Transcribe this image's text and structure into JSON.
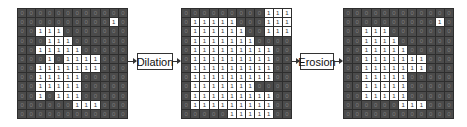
{
  "diagram": {
    "operations": [
      {
        "label": "Dilation"
      },
      {
        "label": "Erosion"
      }
    ],
    "colors": {
      "zero_cell": "#4b4b4b",
      "zero_text": "#7c7c7c",
      "one_cell": "#ffffff",
      "one_text": "#333333",
      "grid_line": "#2e2e2e"
    },
    "grids": {
      "input": [
        [
          0,
          0,
          0,
          0,
          0,
          0,
          0,
          0,
          0,
          0,
          0,
          0
        ],
        [
          0,
          0,
          0,
          0,
          0,
          0,
          0,
          0,
          0,
          0,
          1,
          0
        ],
        [
          0,
          0,
          1,
          1,
          1,
          0,
          0,
          0,
          0,
          0,
          0,
          0
        ],
        [
          0,
          0,
          0,
          1,
          1,
          1,
          0,
          0,
          0,
          0,
          0,
          0
        ],
        [
          0,
          0,
          1,
          1,
          1,
          1,
          1,
          0,
          0,
          0,
          0,
          0
        ],
        [
          0,
          0,
          0,
          1,
          0,
          1,
          1,
          1,
          1,
          0,
          0,
          0
        ],
        [
          0,
          0,
          1,
          1,
          1,
          1,
          1,
          1,
          1,
          0,
          0,
          0
        ],
        [
          0,
          0,
          1,
          1,
          1,
          1,
          1,
          0,
          0,
          0,
          0,
          0
        ],
        [
          0,
          0,
          1,
          1,
          1,
          1,
          1,
          0,
          0,
          0,
          0,
          0
        ],
        [
          0,
          0,
          1,
          0,
          1,
          1,
          1,
          0,
          0,
          0,
          0,
          0
        ],
        [
          0,
          0,
          0,
          0,
          0,
          0,
          1,
          1,
          1,
          0,
          0,
          0
        ],
        [
          0,
          0,
          0,
          0,
          0,
          0,
          0,
          0,
          0,
          0,
          0,
          0
        ]
      ],
      "dilated": [
        [
          0,
          0,
          0,
          0,
          0,
          0,
          0,
          0,
          0,
          1,
          1,
          1
        ],
        [
          0,
          1,
          1,
          1,
          1,
          1,
          0,
          0,
          0,
          1,
          1,
          1
        ],
        [
          0,
          1,
          1,
          1,
          1,
          1,
          1,
          0,
          0,
          1,
          1,
          1
        ],
        [
          0,
          1,
          1,
          1,
          1,
          1,
          1,
          1,
          0,
          0,
          0,
          0
        ],
        [
          0,
          1,
          1,
          1,
          1,
          1,
          1,
          1,
          1,
          1,
          0,
          0
        ],
        [
          0,
          1,
          1,
          1,
          1,
          1,
          1,
          1,
          1,
          1,
          0,
          0
        ],
        [
          0,
          1,
          1,
          1,
          1,
          1,
          1,
          1,
          1,
          1,
          0,
          0
        ],
        [
          0,
          1,
          1,
          1,
          1,
          1,
          1,
          1,
          1,
          1,
          0,
          0
        ],
        [
          0,
          1,
          1,
          1,
          1,
          1,
          1,
          1,
          0,
          0,
          0,
          0
        ],
        [
          0,
          1,
          1,
          1,
          1,
          1,
          1,
          1,
          1,
          1,
          0,
          0
        ],
        [
          0,
          1,
          1,
          1,
          1,
          1,
          1,
          1,
          1,
          1,
          0,
          0
        ],
        [
          0,
          0,
          0,
          0,
          0,
          1,
          1,
          1,
          1,
          1,
          0,
          0
        ]
      ],
      "eroded": [
        [
          0,
          0,
          0,
          0,
          0,
          0,
          0,
          0,
          0,
          0,
          0,
          0
        ],
        [
          0,
          0,
          0,
          0,
          0,
          0,
          0,
          0,
          0,
          0,
          1,
          0
        ],
        [
          0,
          0,
          1,
          1,
          1,
          0,
          0,
          0,
          0,
          0,
          0,
          0
        ],
        [
          0,
          0,
          1,
          1,
          1,
          1,
          0,
          0,
          0,
          0,
          0,
          0
        ],
        [
          0,
          0,
          1,
          1,
          1,
          1,
          1,
          0,
          0,
          0,
          0,
          0
        ],
        [
          0,
          0,
          1,
          1,
          1,
          1,
          1,
          1,
          1,
          0,
          0,
          0
        ],
        [
          0,
          0,
          1,
          1,
          1,
          1,
          1,
          1,
          1,
          0,
          0,
          0
        ],
        [
          0,
          0,
          1,
          1,
          1,
          1,
          1,
          0,
          0,
          0,
          0,
          0
        ],
        [
          0,
          0,
          1,
          1,
          1,
          1,
          1,
          0,
          0,
          0,
          0,
          0
        ],
        [
          0,
          0,
          1,
          1,
          1,
          1,
          1,
          0,
          0,
          0,
          0,
          0
        ],
        [
          0,
          0,
          0,
          0,
          0,
          0,
          1,
          1,
          1,
          0,
          0,
          0
        ],
        [
          0,
          0,
          0,
          0,
          0,
          0,
          0,
          0,
          0,
          0,
          0,
          0
        ]
      ]
    }
  }
}
